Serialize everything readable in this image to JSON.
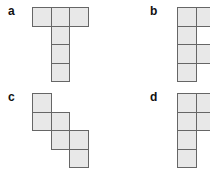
{
  "cell_size": 18.5,
  "colors": {
    "cell_fill": "#e8e8e8",
    "cell_border": "#666666",
    "label": "#111111"
  },
  "panels": [
    {
      "label": "a",
      "label_pos": [
        8,
        5
      ],
      "origin": [
        32,
        7
      ],
      "cells": [
        [
          0,
          0
        ],
        [
          1,
          0
        ],
        [
          2,
          0
        ],
        [
          1,
          1
        ],
        [
          1,
          2
        ],
        [
          1,
          3
        ]
      ]
    },
    {
      "label": "b",
      "label_pos": [
        150,
        5
      ],
      "origin": [
        177,
        7
      ],
      "cells": [
        [
          0,
          0
        ],
        [
          1,
          0
        ],
        [
          0,
          1
        ],
        [
          0,
          2
        ],
        [
          1,
          2
        ],
        [
          0,
          3
        ]
      ]
    },
    {
      "label": "c",
      "label_pos": [
        8,
        91
      ],
      "origin": [
        32,
        93
      ],
      "cells": [
        [
          0,
          0
        ],
        [
          0,
          1
        ],
        [
          1,
          1
        ],
        [
          1,
          2
        ],
        [
          2,
          2
        ],
        [
          2,
          3
        ]
      ]
    },
    {
      "label": "d",
      "label_pos": [
        150,
        91
      ],
      "origin": [
        177,
        93
      ],
      "cells": [
        [
          0,
          0
        ],
        [
          1,
          0
        ],
        [
          0,
          1
        ],
        [
          1,
          1
        ],
        [
          0,
          2
        ],
        [
          0,
          3
        ]
      ]
    }
  ]
}
